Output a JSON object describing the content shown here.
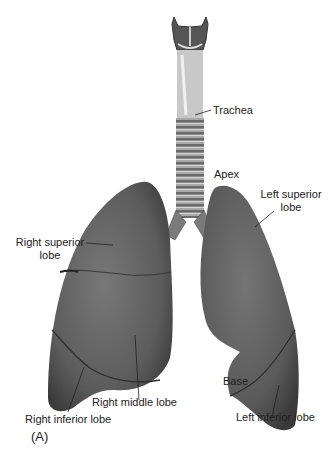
{
  "figure": {
    "panel_label": "(A)",
    "colors": {
      "lung": "#5e5e5e",
      "lung_highlight": "#7a7a7a",
      "lung_shadow": "#3e3e3e",
      "trachea": "#9a9a9a",
      "leader": "#222222",
      "background": "#ffffff"
    },
    "labels": {
      "trachea": "Trachea",
      "apex": "Apex",
      "left_superior_lobe_line1": "Left superior",
      "left_superior_lobe_line2": "lobe",
      "right_superior_lobe_line1": "Right superior",
      "right_superior_lobe_line2": "lobe",
      "right_middle_lobe": "Right middle lobe",
      "right_inferior_lobe": "Right inferior lobe",
      "base": "Base",
      "left_inferior_lobe": "Left inferior lobe"
    }
  }
}
